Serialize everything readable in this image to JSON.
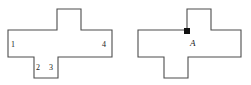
{
  "figure": {
    "canvas": {
      "width": 251,
      "height": 85,
      "background": "#ffffff"
    },
    "stroke_color": "#4d4d4d",
    "label_color": "#1a1a1a",
    "marker_color": "#111111",
    "shapes": [
      {
        "id": "left-cross",
        "name": "left-cross-polygon",
        "points": "57,9 81,9 81,30 112,30 112,57 58,57 58,78 34,78 34,57 8,57 8,30 57,30 57,9",
        "labels": [
          {
            "id": "label-1",
            "text": "1",
            "x": 11,
            "y": 41
          },
          {
            "id": "label-2",
            "text": "2",
            "x": 36,
            "y": 64
          },
          {
            "id": "label-3",
            "text": "3",
            "x": 49,
            "y": 64
          },
          {
            "id": "label-4",
            "text": "4",
            "x": 102,
            "y": 41
          }
        ]
      },
      {
        "id": "right-cross",
        "name": "right-cross-polygon",
        "points": "187,9 211,9 211,30 241,30 241,57 188,57 188,78 164,78 164,57 138,57 138,30 187,30 187,9",
        "labels": [
          {
            "id": "label-A",
            "text": "A",
            "x": 190,
            "y": 39
          }
        ],
        "markers": [
          {
            "id": "vertex-marker-A",
            "x": 184,
            "y": 28,
            "width": 6,
            "height": 6
          }
        ]
      }
    ]
  }
}
